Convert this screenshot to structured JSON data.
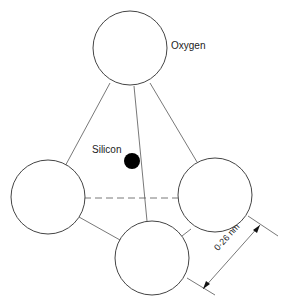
{
  "diagram": {
    "labels": {
      "oxygen": "Oxygen",
      "silicon": "Silicon",
      "dimension": "0·26 nm"
    },
    "atoms": [
      {
        "name": "oxygen-top",
        "cx": 130,
        "cy": 48,
        "r": 37
      },
      {
        "name": "oxygen-left",
        "cx": 48,
        "cy": 197,
        "r": 37
      },
      {
        "name": "oxygen-right",
        "cx": 215,
        "cy": 195,
        "r": 37
      },
      {
        "name": "oxygen-bottom",
        "cx": 152,
        "cy": 258,
        "r": 37
      },
      {
        "name": "silicon",
        "cx": 132,
        "cy": 161,
        "r": 8
      }
    ],
    "colors": {
      "stroke": "#444444",
      "silicon": "#000000",
      "background": "#ffffff"
    }
  }
}
